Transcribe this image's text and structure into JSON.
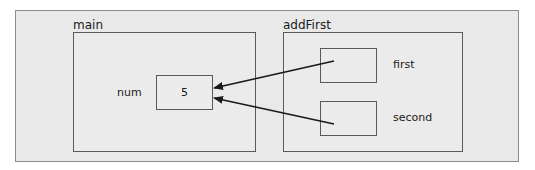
{
  "diagram": {
    "frames": [
      {
        "id": "main",
        "label": "main",
        "variables": [
          {
            "name": "num",
            "value": "5"
          }
        ]
      },
      {
        "id": "addFirst",
        "label": "addFirst",
        "variables": [
          {
            "name": "first",
            "value": "",
            "points_to": "main.num"
          },
          {
            "name": "second",
            "value": "",
            "points_to": "main.num"
          }
        ]
      }
    ],
    "colors": {
      "panel_background": "#e9e9e9",
      "border": "#5a5a5a",
      "arrow": "#1a1a1a"
    }
  }
}
